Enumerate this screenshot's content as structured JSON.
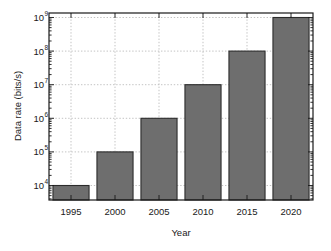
{
  "chart_data": {
    "type": "bar",
    "title": "",
    "xlabel": "Year",
    "ylabel": "Data rate (bits/s)",
    "categories": [
      "1995",
      "2000",
      "2005",
      "2010",
      "2015",
      "2020"
    ],
    "values": [
      10000,
      100000,
      1000000,
      10000000,
      100000000,
      1000000000
    ],
    "value_labels": [
      "1e4",
      "1e5",
      "1e6",
      "1e7",
      "1e8",
      "1e9"
    ],
    "yscale": "log",
    "ylim": [
      2000,
      2000000000
    ],
    "ytick_values": [
      10000,
      100000,
      1000000,
      10000000,
      100000000,
      1000000000
    ],
    "ytick_labels": [
      {
        "mantissa": "10",
        "exponent": "4"
      },
      {
        "mantissa": "10",
        "exponent": "5"
      },
      {
        "mantissa": "10",
        "exponent": "6"
      },
      {
        "mantissa": "10",
        "exponent": "7"
      },
      {
        "mantissa": "10",
        "exponent": "8"
      },
      {
        "mantissa": "10",
        "exponent": "9"
      }
    ],
    "grid": "both-dotted",
    "legend": "none",
    "bar_fill_color": "#6e6e6e",
    "bar_edge_color": "#2b2b2b",
    "grid_color": "#b4b4b4",
    "axis_color": "#1a1a1a",
    "background_color": "#ffffff"
  }
}
